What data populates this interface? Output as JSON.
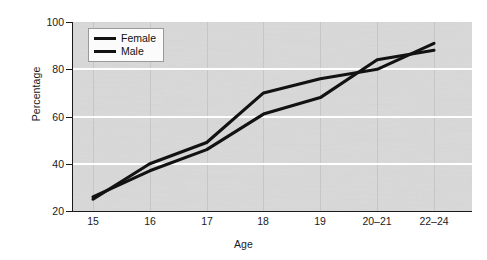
{
  "chart_data": {
    "type": "line",
    "title": "",
    "xlabel": "Age",
    "ylabel": "Percentage",
    "categories": [
      "15",
      "16",
      "17",
      "18",
      "19",
      "20–21",
      "22–24"
    ],
    "ylim": [
      20,
      100
    ],
    "yticks": [
      20,
      40,
      60,
      80,
      100
    ],
    "ytick_labels": [
      "20",
      "40",
      "60",
      "80",
      "100"
    ],
    "grid": "horizontal-white-gridlines-and-light-vertical-category-lines",
    "legend_position": "upper-left-inside-plot",
    "series": [
      {
        "name": "Female",
        "color": "#121212",
        "values": [
          25,
          40,
          49,
          70,
          76,
          80,
          91
        ]
      },
      {
        "name": "Male",
        "color": "#121212",
        "values": [
          26,
          37,
          46,
          61,
          68,
          84,
          88
        ]
      }
    ]
  },
  "legend": {
    "items": [
      {
        "label": "Female"
      },
      {
        "label": "Male"
      }
    ]
  },
  "colors": {
    "plot_background": "#d9d9d9",
    "gridline": "#ffffff",
    "axis": "#1a1a1a",
    "line": "#121212",
    "page_background": "#ffffff"
  }
}
